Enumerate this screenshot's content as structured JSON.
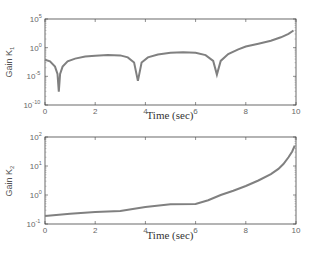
{
  "chart_data": [
    {
      "type": "line",
      "title": "",
      "xlabel": "Time (sec)",
      "ylabel": "Gain K1",
      "ylabel_base": "Gain K",
      "ylabel_sub": "1",
      "yscale": "log",
      "xlim": [
        0,
        10
      ],
      "ylim": [
        1e-10,
        100000.0
      ],
      "xticks": [
        "0",
        "2",
        "4",
        "6",
        "8",
        "10"
      ],
      "yticks": [
        {
          "base": "10",
          "exp": "5"
        },
        {
          "base": "10",
          "exp": "0"
        },
        {
          "base": "10",
          "exp": "-5"
        },
        {
          "base": "10",
          "exp": "-10"
        }
      ],
      "grid": false,
      "line_color": "#808080",
      "series": [
        {
          "name": "K1",
          "x": [
            0,
            0.2,
            0.4,
            0.5,
            0.55,
            0.6,
            0.7,
            0.9,
            1.2,
            1.6,
            2.0,
            2.5,
            3.0,
            3.3,
            3.55,
            3.7,
            3.85,
            4.1,
            4.5,
            5.0,
            5.5,
            6.0,
            6.4,
            6.7,
            6.85,
            7.0,
            7.3,
            7.7,
            8.0,
            8.5,
            9.0,
            9.4,
            9.7,
            9.9
          ],
          "log10_y": [
            -2.1,
            -2.4,
            -3.3,
            -4.6,
            -7.7,
            -4.6,
            -3.3,
            -2.4,
            -1.9,
            -1.55,
            -1.4,
            -1.3,
            -1.35,
            -1.7,
            -2.6,
            -5.8,
            -2.6,
            -1.7,
            -1.2,
            -0.9,
            -0.8,
            -0.9,
            -1.3,
            -2.3,
            -4.7,
            -2.3,
            -1.1,
            -0.3,
            0.2,
            0.7,
            1.2,
            1.8,
            2.4,
            3.0
          ]
        }
      ]
    },
    {
      "type": "line",
      "title": "",
      "xlabel": "Time (sec)",
      "ylabel": "Gain K2",
      "ylabel_base": "Gain K",
      "ylabel_sub": "2",
      "yscale": "log",
      "xlim": [
        0,
        10
      ],
      "ylim": [
        0.1,
        100
      ],
      "xticks": [
        "0",
        "2",
        "4",
        "6",
        "8",
        "10"
      ],
      "yticks": [
        {
          "base": "10",
          "exp": "2"
        },
        {
          "base": "10",
          "exp": "1"
        },
        {
          "base": "10",
          "exp": "0"
        },
        {
          "base": "10",
          "exp": "-1"
        }
      ],
      "grid": false,
      "line_color": "#808080",
      "series": [
        {
          "name": "K2",
          "x": [
            0,
            1,
            2,
            3,
            3.5,
            4,
            5,
            6,
            6.5,
            7,
            7.5,
            8,
            8.5,
            9,
            9.3,
            9.5,
            9.7,
            9.85,
            9.95
          ],
          "log10_y": [
            -0.72,
            -0.65,
            -0.59,
            -0.55,
            -0.48,
            -0.41,
            -0.32,
            -0.31,
            -0.18,
            0.0,
            0.15,
            0.31,
            0.5,
            0.72,
            0.9,
            1.07,
            1.3,
            1.5,
            1.7
          ]
        }
      ]
    }
  ]
}
